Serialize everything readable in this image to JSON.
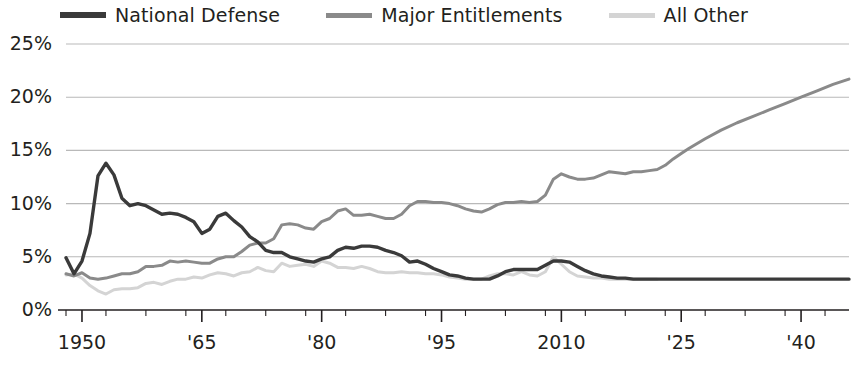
{
  "legend": {
    "items": [
      {
        "label": "National Defense",
        "color": "#3a3a3a",
        "icon": "line-swatch-icon"
      },
      {
        "label": "Major Entitlements",
        "color": "#8a8a8a",
        "icon": "line-swatch-icon"
      },
      {
        "label": "All Other",
        "color": "#d4d4d4",
        "icon": "line-swatch-icon"
      }
    ]
  },
  "chart_data": {
    "type": "line",
    "title": "",
    "subtitle": "",
    "xlabel": "",
    "ylabel": "",
    "xlim": [
      1948,
      2046
    ],
    "ylim": [
      0,
      25
    ],
    "grid": true,
    "legend_position": "top-left",
    "y_ticks": [
      "0%",
      "5%",
      "10%",
      "15%",
      "20%",
      "25%"
    ],
    "y_tick_values": [
      0,
      5,
      10,
      15,
      20,
      25
    ],
    "x_ticks": [
      "1950",
      "'65",
      "'80",
      "'95",
      "2010",
      "'25",
      "'40"
    ],
    "x_tick_values": [
      1950,
      1965,
      1980,
      1995,
      2010,
      2025,
      2040
    ],
    "x_minor_tick_step": 5,
    "value_units": "percent of GDP",
    "series": [
      {
        "name": "National Defense",
        "color": "#3a3a3a",
        "x": [
          1948,
          1949,
          1950,
          1951,
          1952,
          1953,
          1954,
          1955,
          1956,
          1957,
          1958,
          1959,
          1960,
          1961,
          1962,
          1963,
          1964,
          1965,
          1966,
          1967,
          1968,
          1969,
          1970,
          1971,
          1972,
          1973,
          1974,
          1975,
          1976,
          1977,
          1978,
          1979,
          1980,
          1981,
          1982,
          1983,
          1984,
          1985,
          1986,
          1987,
          1988,
          1989,
          1990,
          1991,
          1992,
          1993,
          1994,
          1995,
          1996,
          1997,
          1998,
          1999,
          2000,
          2001,
          2002,
          2003,
          2004,
          2005,
          2006,
          2007,
          2008,
          2009,
          2010,
          2011,
          2012,
          2013,
          2014,
          2015,
          2016,
          2017,
          2018,
          2019,
          2020,
          2021,
          2022,
          2023,
          2024,
          2025,
          2030,
          2035,
          2040,
          2046
        ],
        "values": [
          4.9,
          3.4,
          4.6,
          7.2,
          12.6,
          13.8,
          12.7,
          10.5,
          9.8,
          10.0,
          9.8,
          9.4,
          9.0,
          9.1,
          9.0,
          8.7,
          8.3,
          7.2,
          7.6,
          8.8,
          9.1,
          8.4,
          7.8,
          6.9,
          6.4,
          5.6,
          5.4,
          5.4,
          5.0,
          4.8,
          4.6,
          4.5,
          4.8,
          5.0,
          5.6,
          5.9,
          5.8,
          6.0,
          6.0,
          5.9,
          5.6,
          5.4,
          5.1,
          4.5,
          4.6,
          4.3,
          3.9,
          3.6,
          3.3,
          3.2,
          3.0,
          2.9,
          2.9,
          2.9,
          3.2,
          3.6,
          3.8,
          3.8,
          3.8,
          3.8,
          4.2,
          4.6,
          4.6,
          4.5,
          4.1,
          3.7,
          3.4,
          3.2,
          3.1,
          3.0,
          3.0,
          2.9,
          2.9,
          2.9,
          2.9,
          2.9,
          2.9,
          2.9,
          2.9,
          2.9,
          2.9,
          2.9
        ]
      },
      {
        "name": "Major Entitlements",
        "color": "#8a8a8a",
        "x": [
          1948,
          1949,
          1950,
          1951,
          1952,
          1953,
          1954,
          1955,
          1956,
          1957,
          1958,
          1959,
          1960,
          1961,
          1962,
          1963,
          1964,
          1965,
          1966,
          1967,
          1968,
          1969,
          1970,
          1971,
          1972,
          1973,
          1974,
          1975,
          1976,
          1977,
          1978,
          1979,
          1980,
          1981,
          1982,
          1983,
          1984,
          1985,
          1986,
          1987,
          1988,
          1989,
          1990,
          1991,
          1992,
          1993,
          1994,
          1995,
          1996,
          1997,
          1998,
          1999,
          2000,
          2001,
          2002,
          2003,
          2004,
          2005,
          2006,
          2007,
          2008,
          2009,
          2010,
          2011,
          2012,
          2013,
          2014,
          2015,
          2016,
          2017,
          2018,
          2019,
          2020,
          2021,
          2022,
          2023,
          2024,
          2025,
          2026,
          2028,
          2030,
          2032,
          2034,
          2036,
          2038,
          2040,
          2042,
          2044,
          2046
        ],
        "values": [
          3.4,
          3.2,
          3.5,
          3.0,
          2.9,
          3.0,
          3.2,
          3.4,
          3.4,
          3.6,
          4.1,
          4.1,
          4.2,
          4.6,
          4.5,
          4.6,
          4.5,
          4.4,
          4.4,
          4.8,
          5.0,
          5.0,
          5.5,
          6.1,
          6.3,
          6.3,
          6.7,
          8.0,
          8.1,
          8.0,
          7.7,
          7.6,
          8.3,
          8.6,
          9.3,
          9.5,
          8.9,
          8.9,
          9.0,
          8.8,
          8.6,
          8.6,
          9.0,
          9.8,
          10.2,
          10.2,
          10.1,
          10.1,
          10.0,
          9.8,
          9.5,
          9.3,
          9.2,
          9.5,
          9.9,
          10.1,
          10.1,
          10.2,
          10.1,
          10.2,
          10.8,
          12.3,
          12.8,
          12.5,
          12.3,
          12.3,
          12.4,
          12.7,
          13.0,
          12.9,
          12.8,
          13.0,
          13.0,
          13.1,
          13.2,
          13.6,
          14.2,
          14.7,
          15.2,
          16.1,
          16.9,
          17.6,
          18.2,
          18.8,
          19.4,
          20.0,
          20.6,
          21.2,
          21.7
        ]
      },
      {
        "name": "All Other",
        "color": "#d4d4d4",
        "x": [
          1948,
          1949,
          1950,
          1951,
          1952,
          1953,
          1954,
          1955,
          1956,
          1957,
          1958,
          1959,
          1960,
          1961,
          1962,
          1963,
          1964,
          1965,
          1966,
          1967,
          1968,
          1969,
          1970,
          1971,
          1972,
          1973,
          1974,
          1975,
          1976,
          1977,
          1978,
          1979,
          1980,
          1981,
          1982,
          1983,
          1984,
          1985,
          1986,
          1987,
          1988,
          1989,
          1990,
          1991,
          1992,
          1993,
          1994,
          1995,
          1996,
          1997,
          1998,
          1999,
          2000,
          2001,
          2002,
          2003,
          2004,
          2005,
          2006,
          2007,
          2008,
          2009,
          2010,
          2011,
          2012,
          2013,
          2014,
          2015,
          2016,
          2017,
          2018,
          2019,
          2020,
          2021,
          2022
        ],
        "values": [
          3.3,
          3.4,
          3.0,
          2.3,
          1.8,
          1.5,
          1.9,
          2.0,
          2.0,
          2.1,
          2.5,
          2.6,
          2.4,
          2.7,
          2.9,
          2.9,
          3.1,
          3.0,
          3.3,
          3.5,
          3.4,
          3.2,
          3.5,
          3.6,
          4.0,
          3.7,
          3.6,
          4.4,
          4.1,
          4.2,
          4.3,
          4.1,
          4.6,
          4.4,
          4.0,
          4.0,
          3.9,
          4.1,
          3.9,
          3.6,
          3.5,
          3.5,
          3.6,
          3.5,
          3.5,
          3.4,
          3.4,
          3.3,
          3.1,
          3.0,
          2.9,
          2.9,
          2.9,
          3.2,
          3.4,
          3.4,
          3.3,
          3.6,
          3.3,
          3.2,
          3.6,
          5.0,
          4.3,
          3.6,
          3.2,
          3.1,
          3.0,
          3.0,
          2.9,
          2.9,
          2.9,
          2.9,
          2.9,
          2.9,
          2.9
        ]
      }
    ]
  }
}
